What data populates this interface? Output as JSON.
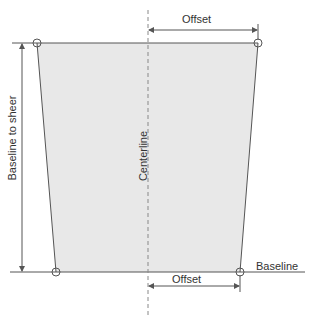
{
  "diagram": {
    "colors": {
      "fill": "#e8e8e8",
      "line": "#555555",
      "text": "#333333"
    },
    "labels": {
      "offset_top": "Offset",
      "offset_bottom": "Offset",
      "baseline": "Baseline",
      "baseline_to_sheer": "Baseline to sheer",
      "centerline": "Centerline"
    }
  }
}
